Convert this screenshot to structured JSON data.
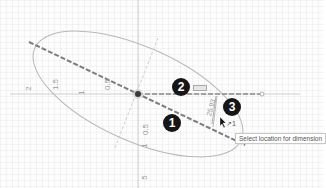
{
  "app": {
    "type": "CAD sketch canvas",
    "mode": "Sketch Dimension"
  },
  "canvas": {
    "background": "#fdfdfd",
    "grid": true,
    "axis_color": "#bdbdbd",
    "horizontal_axis_labels": [
      "2",
      "1.5",
      "1",
      "0.5"
    ],
    "vertical_axis_labels": [
      "0.5",
      "1",
      "5"
    ]
  },
  "sketch": {
    "ellipse": {
      "cx": 138,
      "cy": 94,
      "rx": 112,
      "ry": 48,
      "rotation_deg": 21,
      "stroke": "#b5b5b5"
    },
    "major_axis": {
      "x1": 30,
      "y1": 42,
      "x2": 244,
      "y2": 143,
      "stroke": "#7a7a7a",
      "dashed": true
    },
    "minor_axis": {
      "x1": 160,
      "y1": 32,
      "x2": 114,
      "y2": 156,
      "stroke": "#c8c8c8",
      "dashed": true
    },
    "construction_line": {
      "x1": 138,
      "y1": 94,
      "x2": 262,
      "y2": 94,
      "stroke": "#8a8a8a",
      "dashed": true
    },
    "center_point": {
      "x": 138,
      "y": 94,
      "color": "#3a3a3a"
    }
  },
  "steps": [
    {
      "number": "1",
      "x": 163,
      "y": 114
    },
    {
      "number": "2",
      "x": 172,
      "y": 79
    },
    {
      "number": "3",
      "x": 223,
      "y": 98
    }
  ],
  "dimension": {
    "preview_text": "25.93",
    "cursor_label": "↗1"
  },
  "tooltip": {
    "text": "Select location for dimension"
  },
  "colors": {
    "badge": "#161616",
    "badge_text": "#ffffff"
  }
}
